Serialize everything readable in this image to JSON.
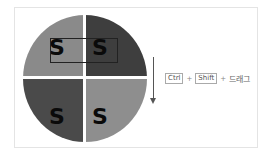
{
  "diagram": {
    "quadrants": [
      {
        "position": "top-left",
        "letter": "S",
        "color": "#8a8a8a"
      },
      {
        "position": "top-right",
        "letter": "S",
        "color": "#3e3e3e"
      },
      {
        "position": "bottom-left",
        "letter": "S",
        "color": "#4a4a4a"
      },
      {
        "position": "bottom-right",
        "letter": "S",
        "color": "#8e8e8e"
      }
    ],
    "shortcut": {
      "key1": "Ctrl",
      "plus1": "+",
      "key2": "Shift",
      "plus2": "+",
      "action": "드래그"
    }
  }
}
